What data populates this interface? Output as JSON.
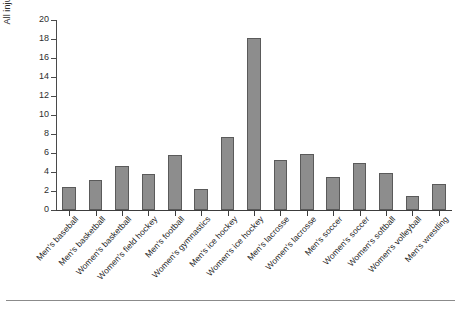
{
  "chart_data": {
    "type": "bar",
    "title": "",
    "subtitle": "",
    "xlabel": "",
    "ylabel": "All injuries (%)",
    "ylim": [
      0,
      20
    ],
    "ytick_step": 2,
    "yticks": [
      0,
      2,
      4,
      6,
      8,
      10,
      12,
      14,
      16,
      18,
      20
    ],
    "grid": false,
    "legend": null,
    "bar_color": "#8d8d8d",
    "bar_edge_color": "#5a5a5a",
    "categories": [
      "Men's baseball",
      "Men's basketball",
      "Women's basketball",
      "Women's field hockey",
      "Men's football",
      "Women's gymnastics",
      "Men's ice hockey",
      "Women's ice hockey",
      "Men's lacrosse",
      "Women's lacrosse",
      "Men's soccer",
      "Women's soccer",
      "Women's softball",
      "Women's volleyball",
      "Men's wrestling"
    ],
    "values": [
      2.4,
      3.2,
      4.6,
      3.8,
      5.8,
      2.2,
      7.7,
      18.1,
      5.3,
      5.9,
      3.5,
      4.9,
      3.9,
      1.5,
      2.7
    ]
  }
}
